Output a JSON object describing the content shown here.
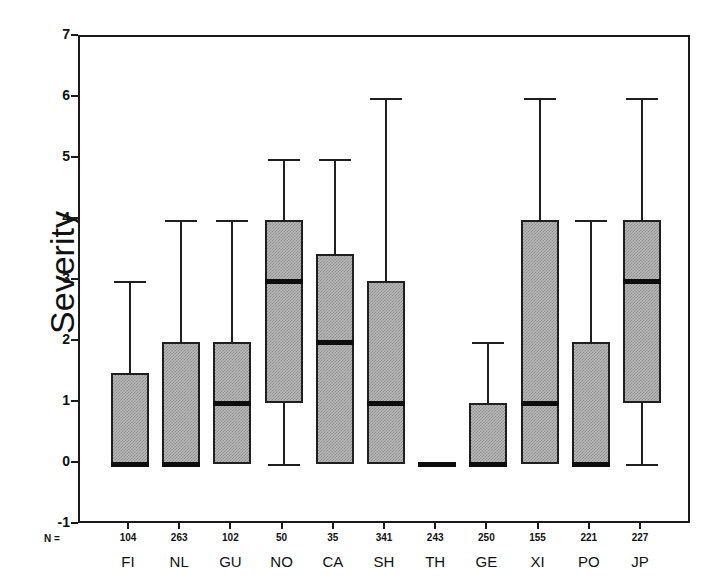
{
  "chart_data": {
    "type": "box",
    "title": "",
    "xlabel": "",
    "ylabel": "Severity",
    "ylim": [
      -1,
      7
    ],
    "yticks": [
      -1,
      0,
      1,
      2,
      3,
      4,
      5,
      6,
      7
    ],
    "grid": false,
    "legend": null,
    "n_prefix": "N =",
    "categories": [
      "FI",
      "NL",
      "GU",
      "NO",
      "CA",
      "SH",
      "TH",
      "GE",
      "XI",
      "PO",
      "JP"
    ],
    "counts": [
      104,
      263,
      102,
      50,
      35,
      341,
      243,
      250,
      155,
      221,
      227
    ],
    "boxes": [
      {
        "label": "FI",
        "n": 104,
        "whisker_low": 0,
        "q1": 0,
        "median": 0,
        "q3": 1.5,
        "whisker_high": 3
      },
      {
        "label": "NL",
        "n": 263,
        "whisker_low": 0,
        "q1": 0,
        "median": 0,
        "q3": 2,
        "whisker_high": 4
      },
      {
        "label": "GU",
        "n": 102,
        "whisker_low": 0,
        "q1": 0,
        "median": 1,
        "q3": 2,
        "whisker_high": 4
      },
      {
        "label": "NO",
        "n": 50,
        "whisker_low": 0,
        "q1": 1,
        "median": 3,
        "q3": 4,
        "whisker_high": 5
      },
      {
        "label": "CA",
        "n": 35,
        "whisker_low": 0,
        "q1": 0,
        "median": 2,
        "q3": 3.45,
        "whisker_high": 5
      },
      {
        "label": "SH",
        "n": 341,
        "whisker_low": 0,
        "q1": 0,
        "median": 1,
        "q3": 3,
        "whisker_high": 6
      },
      {
        "label": "TH",
        "n": 243,
        "whisker_low": 0,
        "q1": 0,
        "median": 0,
        "q3": 0,
        "whisker_high": 0
      },
      {
        "label": "GE",
        "n": 250,
        "whisker_low": 0,
        "q1": 0,
        "median": 0,
        "q3": 1,
        "whisker_high": 2
      },
      {
        "label": "XI",
        "n": 155,
        "whisker_low": 0,
        "q1": 0,
        "median": 1,
        "q3": 4,
        "whisker_high": 6
      },
      {
        "label": "PO",
        "n": 221,
        "whisker_low": 0,
        "q1": 0,
        "median": 0,
        "q3": 2,
        "whisker_high": 4
      },
      {
        "label": "JP",
        "n": 227,
        "whisker_low": 0,
        "q1": 1,
        "median": 3,
        "q3": 4,
        "whisker_high": 6
      }
    ],
    "colors": {
      "box_fill": "#b9b9b9",
      "box_edge": "#1f1f1f",
      "median": "#0d0d0d",
      "axis": "#1a1a1a",
      "background": "#ffffff"
    }
  }
}
